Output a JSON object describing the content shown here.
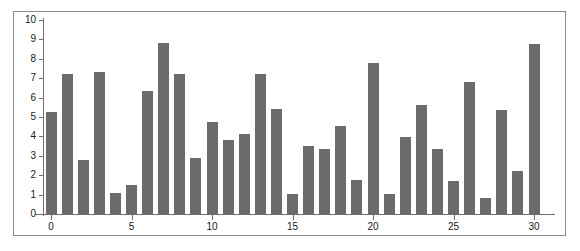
{
  "chart": {
    "accent_color": "#6b6b6b",
    "axis_color": "#6e6e6e",
    "frame_color": "#8a8a8a",
    "background": "#ffffff"
  },
  "chart_data": {
    "type": "bar",
    "title": "",
    "subtitle": "",
    "xlabel": "",
    "ylabel": "",
    "grid": false,
    "legend": false,
    "legend_position": "none",
    "bar_color": "#6b6b6b",
    "xlim": [
      -0.5,
      30.5
    ],
    "ylim": [
      0,
      10
    ],
    "x_tick_labels": [
      "0",
      "5",
      "10",
      "15",
      "20",
      "25",
      "30"
    ],
    "x_tick_values": [
      0,
      5,
      10,
      15,
      20,
      25,
      30
    ],
    "y_tick_labels": [
      "0",
      "1",
      "2",
      "3",
      "4",
      "5",
      "6",
      "7",
      "8",
      "9",
      "10"
    ],
    "y_tick_values": [
      0,
      1,
      2,
      3,
      4,
      5,
      6,
      7,
      8,
      9,
      10
    ],
    "categories": [
      0,
      1,
      2,
      3,
      4,
      5,
      6,
      7,
      8,
      9,
      10,
      11,
      12,
      13,
      14,
      15,
      16,
      17,
      18,
      19,
      20,
      21,
      22,
      23,
      24,
      25,
      26,
      27,
      28,
      29,
      30
    ],
    "values": [
      5.25,
      7.2,
      2.8,
      7.3,
      1.1,
      1.5,
      6.35,
      8.8,
      7.2,
      2.9,
      4.75,
      3.8,
      4.1,
      7.2,
      5.4,
      1.05,
      3.5,
      3.35,
      4.55,
      1.75,
      7.8,
      1.05,
      3.95,
      5.6,
      3.35,
      1.7,
      6.8,
      0.85,
      5.35,
      2.2,
      8.75
    ]
  }
}
